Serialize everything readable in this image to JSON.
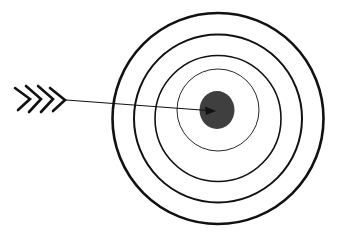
{
  "diagram": {
    "type": "target-with-arrow",
    "colors": {
      "background": "#ffffff",
      "ring_stroke": "#111111",
      "bullseye_fill": "#3f3f3f",
      "arrow_stroke": "#111111"
    },
    "target": {
      "center": [
        218,
        118
      ],
      "rings": [
        {
          "name": "outer",
          "radius": 106,
          "stroke_width": 2.6
        },
        {
          "name": "second",
          "radius": 84,
          "stroke_width": 2.0
        },
        {
          "name": "third",
          "radius": 63,
          "stroke_width": 1.6
        },
        {
          "name": "inner",
          "radius": 44,
          "stroke_width": 0.9
        }
      ],
      "bullseye": {
        "rx": 17,
        "ry": 19
      }
    },
    "arrow": {
      "tail": [
        66,
        100
      ],
      "tip": [
        214,
        112
      ],
      "fletching_count": 4
    }
  }
}
